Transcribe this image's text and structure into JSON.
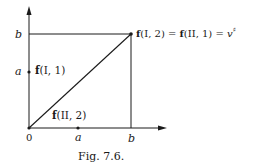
{
  "figure": {
    "caption": "Fig. 7.6.",
    "axes": {
      "origin_label": "0",
      "x_ticks": [
        {
          "label": "a"
        },
        {
          "label": "b"
        }
      ],
      "y_ticks": [
        {
          "label": "b"
        },
        {
          "label": "a"
        }
      ]
    },
    "points": {
      "f_I_1": {
        "f": "f",
        "args": "(I, 1)"
      },
      "f_II_2": {
        "f": "f",
        "args": "(II, 2)"
      },
      "corner": {
        "f1": "f",
        "args1": "(I, 2) = ",
        "f2": "f",
        "args2": "(II, 1) = ",
        "v": "v",
        "sup": "♯"
      }
    },
    "colors": {
      "ink": "#1a1a1a",
      "background": "#ffffff"
    }
  }
}
